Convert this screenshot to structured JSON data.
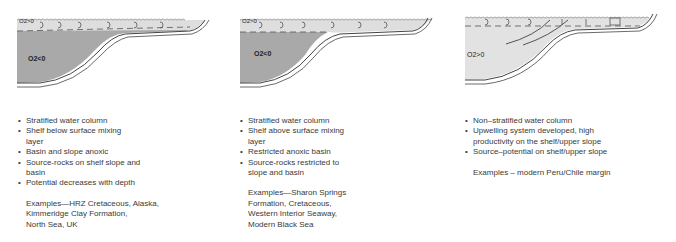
{
  "colors": {
    "anoxic_fill": "#a9a9a9",
    "oxic_fill": "#dedede",
    "line": "#4a4a4a",
    "text": "#3a3a3a"
  },
  "panels": [
    {
      "surface_label": "O2>0",
      "deep_label": "O2<0",
      "bullets": [
        "Stratified water column",
        "Shelf below surface mixing layer",
        "Basin and slope anoxic",
        "Source-rocks on shelf slope and basin",
        "Potential decreases with depth"
      ],
      "examples": [
        "Examples—HRZ Cretaceous, Alaska,",
        "Kimmeridge Clay Formation,",
        "North Sea, UK"
      ]
    },
    {
      "surface_label": "O2>0",
      "deep_label": "O2<0",
      "bullets": [
        "Stratified water column",
        "Shelf above surface mixing layer",
        "Restricted anoxic basin",
        "Source-rocks restricted to slope and basin"
      ],
      "examples": [
        "Examples—Sharon Springs",
        "Formation, Cretaceous,",
        "Western Interior Seaway,",
        "Modern Black Sea"
      ]
    },
    {
      "deep_label": "O2>0",
      "bullets": [
        "Non–stratified water column",
        "Upwelling system developed, high productivity on the shelf/upper slope",
        "Source–potential on shelf/upper slope"
      ],
      "examples": [
        "Examples – modern Peru/Chile margin"
      ]
    }
  ]
}
